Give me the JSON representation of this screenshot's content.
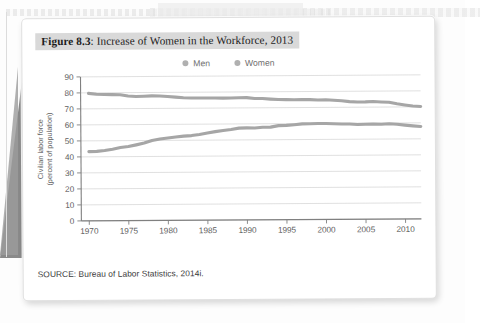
{
  "caption": {
    "figure_number": "Figure 8.3",
    "separator": ": ",
    "title": "Increase of Women in the Workforce, 2013"
  },
  "source": {
    "text": "SOURCE: Bureau of Labor Statistics, 2014i."
  },
  "colors": {
    "line": "#a6a6a6",
    "legend_marker": "#b0b0b0",
    "grid": "#d2d2d2",
    "axis": "#808080",
    "caption_highlight": "#d9d9d9"
  },
  "chart_data": {
    "type": "line",
    "title": "Increase of Women in the Workforce, 2013",
    "xlabel": "",
    "ylabel": "Civilian labor force (percent of population)",
    "ylabel_line1": "Civilian labor force",
    "ylabel_line2": "(percent of population)",
    "xlim": [
      1969,
      2012
    ],
    "ylim": [
      0,
      90
    ],
    "ytick_labels": [
      "0",
      "10",
      "20",
      "30",
      "40",
      "50",
      "60",
      "70",
      "80",
      "90"
    ],
    "yticks": [
      0,
      10,
      20,
      30,
      40,
      50,
      60,
      70,
      80,
      90
    ],
    "xtick_labels": [
      "1970",
      "1975",
      "1980",
      "1985",
      "1990",
      "1995",
      "2000",
      "2005",
      "2010"
    ],
    "xticks": [
      1970,
      1975,
      1980,
      1985,
      1990,
      1995,
      2000,
      2005,
      2010
    ],
    "grid": true,
    "legend_position": "top-center",
    "x": [
      1970,
      1971,
      1972,
      1973,
      1974,
      1975,
      1976,
      1977,
      1978,
      1979,
      1980,
      1981,
      1982,
      1983,
      1984,
      1985,
      1986,
      1987,
      1988,
      1989,
      1990,
      1991,
      1992,
      1993,
      1994,
      1995,
      1996,
      1997,
      1998,
      1999,
      2000,
      2001,
      2002,
      2003,
      2004,
      2005,
      2006,
      2007,
      2008,
      2009,
      2010,
      2011,
      2012
    ],
    "series": [
      {
        "name": "Men",
        "values": [
          79.7,
          79.1,
          78.9,
          78.8,
          78.7,
          77.9,
          77.5,
          77.7,
          77.9,
          77.8,
          77.4,
          77.0,
          76.6,
          76.4,
          76.4,
          76.3,
          76.3,
          76.2,
          76.2,
          76.4,
          76.4,
          75.8,
          75.8,
          75.4,
          75.1,
          75.0,
          74.9,
          75.0,
          74.9,
          74.7,
          74.8,
          74.4,
          74.1,
          73.5,
          73.3,
          73.3,
          73.5,
          73.2,
          73.0,
          72.0,
          71.2,
          70.5,
          70.2
        ]
      },
      {
        "name": "Women",
        "values": [
          43.3,
          43.4,
          43.9,
          44.7,
          45.7,
          46.3,
          47.3,
          48.4,
          50.0,
          50.9,
          51.5,
          52.1,
          52.6,
          52.9,
          53.6,
          54.5,
          55.3,
          56.0,
          56.6,
          57.4,
          57.5,
          57.4,
          57.8,
          57.9,
          58.8,
          58.9,
          59.3,
          59.8,
          59.8,
          60.0,
          59.9,
          59.8,
          59.6,
          59.5,
          59.2,
          59.3,
          59.4,
          59.3,
          59.5,
          59.2,
          58.6,
          58.1,
          57.7
        ]
      }
    ],
    "legend": [
      "Men",
      "Women"
    ]
  }
}
